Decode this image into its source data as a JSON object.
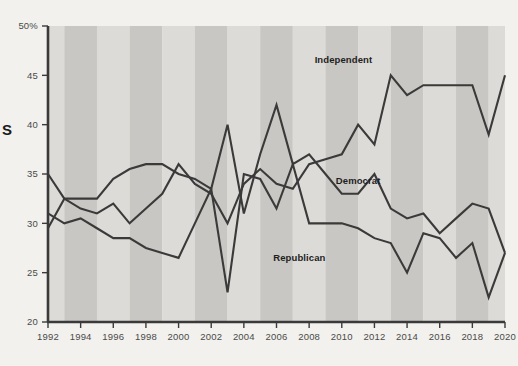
{
  "chart_data": {
    "type": "line",
    "title": "",
    "xlabel": "",
    "ylabel": "",
    "xlim": [
      1992,
      2020
    ],
    "ylim": [
      20,
      50
    ],
    "grid": false,
    "legend_position": "inline-labels",
    "y_ticks": [
      "20",
      "25",
      "30",
      "35",
      "40",
      "45",
      "50%"
    ],
    "y_tick_values": [
      20,
      25,
      30,
      35,
      40,
      45,
      50
    ],
    "x_ticks": [
      "1992",
      "1994",
      "1996",
      "1998",
      "2000",
      "2002",
      "2004",
      "2006",
      "2008",
      "2010",
      "2012",
      "2014",
      "2016",
      "2018",
      "2020"
    ],
    "x_tick_values": [
      1992,
      1994,
      1996,
      1998,
      2000,
      2002,
      2004,
      2006,
      2008,
      2010,
      2012,
      2014,
      2016,
      2018,
      2020
    ],
    "x": [
      1992,
      1993,
      1994,
      1995,
      1996,
      1997,
      1998,
      1999,
      2000,
      2001,
      2002,
      2003,
      2004,
      2005,
      2006,
      2007,
      2008,
      2009,
      2010,
      2011,
      2012,
      2013,
      2014,
      2015,
      2016,
      2017,
      2018,
      2019,
      2020
    ],
    "series": [
      {
        "name": "Independent",
        "label": "Independent",
        "color": "#3a3a3a",
        "label_x": 2010.1,
        "label_y": 46.3,
        "values": [
          29.5,
          32.5,
          31.5,
          31.0,
          32.0,
          30.0,
          31.5,
          33.0,
          36.0,
          34.0,
          33.0,
          30.0,
          34.0,
          35.5,
          34.0,
          33.5,
          36.0,
          36.5,
          37.0,
          40.0,
          38.0,
          45.0,
          43.0,
          44.0,
          44.0,
          44.0,
          44.0,
          39.0,
          45.0
        ]
      },
      {
        "name": "Democrat",
        "label": "Democrat",
        "color": "#3a3a3a",
        "label_x": 2011.0,
        "label_y": 34.0,
        "values": [
          35.0,
          32.5,
          32.5,
          32.5,
          34.5,
          35.5,
          36.0,
          36.0,
          35.0,
          34.5,
          33.5,
          40.0,
          31.0,
          37.0,
          42.0,
          36.0,
          37.0,
          35.0,
          33.0,
          33.0,
          35.0,
          31.5,
          30.5,
          31.0,
          29.0,
          30.5,
          32.0,
          31.5,
          27.0
        ]
      },
      {
        "name": "Republican",
        "label": "Republican",
        "color": "#3a3a3a",
        "label_x": 2007.4,
        "label_y": 26.2,
        "values": [
          31.0,
          30.0,
          30.5,
          29.5,
          28.5,
          28.5,
          27.5,
          27.0,
          26.5,
          30.0,
          33.5,
          23.0,
          35.0,
          34.5,
          31.5,
          36.0,
          30.0,
          30.0,
          30.0,
          29.5,
          28.5,
          28.0,
          25.0,
          29.0,
          28.5,
          26.5,
          28.0,
          22.5,
          27.0
        ]
      }
    ],
    "band_color_dark": "#c9c7c3",
    "band_color_light": "#dddbd7",
    "background": "#f2f1ee",
    "axis_color": "#3a3a3a"
  },
  "edge_marker": {
    "glyph": "S"
  }
}
